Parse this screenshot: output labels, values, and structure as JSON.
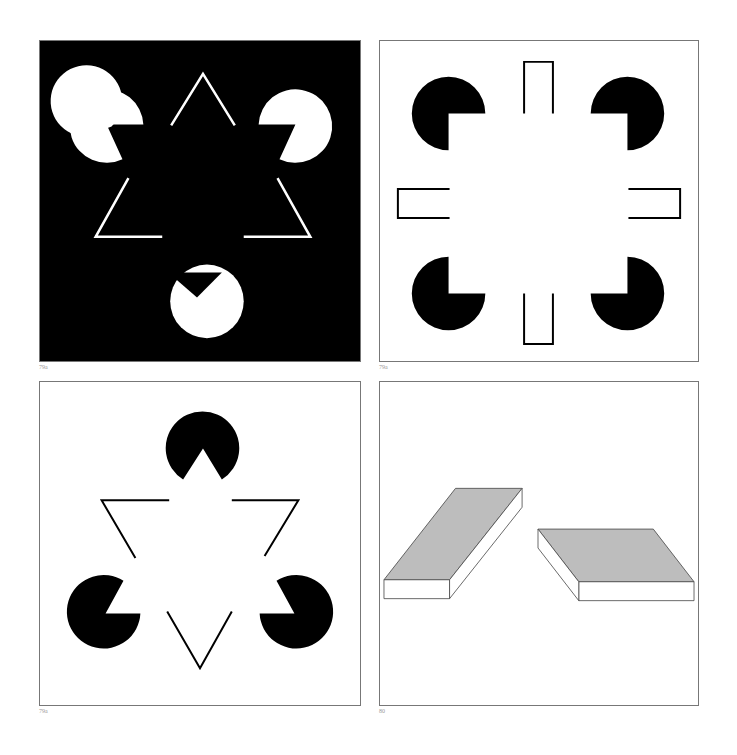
{
  "figures": [
    {
      "id": "fig-79a-black",
      "caption": "79a",
      "background": "#000000",
      "foreground": "#ffffff",
      "description": "Kanizsa illusory triangle, white inducers on black"
    },
    {
      "id": "fig-79a-square",
      "caption": "79a",
      "background": "#ffffff",
      "foreground": "#000000",
      "description": "Illusory square with four quarter-cut disks and four open rectangles"
    },
    {
      "id": "fig-79a-triangle",
      "caption": "79a",
      "background": "#ffffff",
      "foreground": "#000000",
      "description": "Kanizsa illusory triangle, black inducers on white"
    },
    {
      "id": "fig-80-tables",
      "caption": "80",
      "background": "#ffffff",
      "foreground": "#000000",
      "fill": "#bdbdbd",
      "description": "Two parallelogram slabs (Shepard tables illusion)"
    }
  ]
}
